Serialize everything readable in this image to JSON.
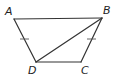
{
  "diagram": {
    "type": "geometry",
    "shape": "isosceles trapezoid",
    "vertices": [
      {
        "label": "A",
        "x": 14,
        "y": 19,
        "label_x": 5,
        "label_y": 15
      },
      {
        "label": "B",
        "x": 102,
        "y": 18,
        "label_x": 103,
        "label_y": 14
      },
      {
        "label": "C",
        "x": 81,
        "y": 62,
        "label_x": 81,
        "label_y": 74
      },
      {
        "label": "D",
        "x": 36,
        "y": 62,
        "label_x": 28,
        "label_y": 74
      }
    ],
    "segments": [
      {
        "from": "A",
        "to": "B"
      },
      {
        "from": "B",
        "to": "C"
      },
      {
        "from": "C",
        "to": "D"
      },
      {
        "from": "D",
        "to": "A"
      },
      {
        "from": "D",
        "to": "B",
        "role": "diagonal"
      }
    ],
    "congruence_marks": [
      {
        "segment": "AD",
        "ticks": 1,
        "x": 24,
        "y": 39
      },
      {
        "segment": "BC",
        "ticks": 1,
        "x": 91,
        "y": 39
      }
    ],
    "colors": {
      "stroke": "#333333",
      "label": "#222222",
      "background": "#ffffff"
    }
  }
}
